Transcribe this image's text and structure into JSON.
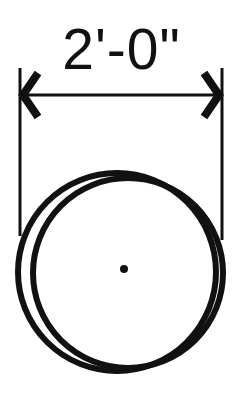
{
  "diagram": {
    "type": "plan-symbol-dimensioned",
    "dimension": {
      "label": "2'-0\"",
      "orientation": "horizontal",
      "terminator": "arrow-chevron"
    },
    "shape": {
      "kind": "circle",
      "description": "double-line circle with center point"
    },
    "colors": {
      "ink": "#111111",
      "background": "#ffffff"
    }
  }
}
